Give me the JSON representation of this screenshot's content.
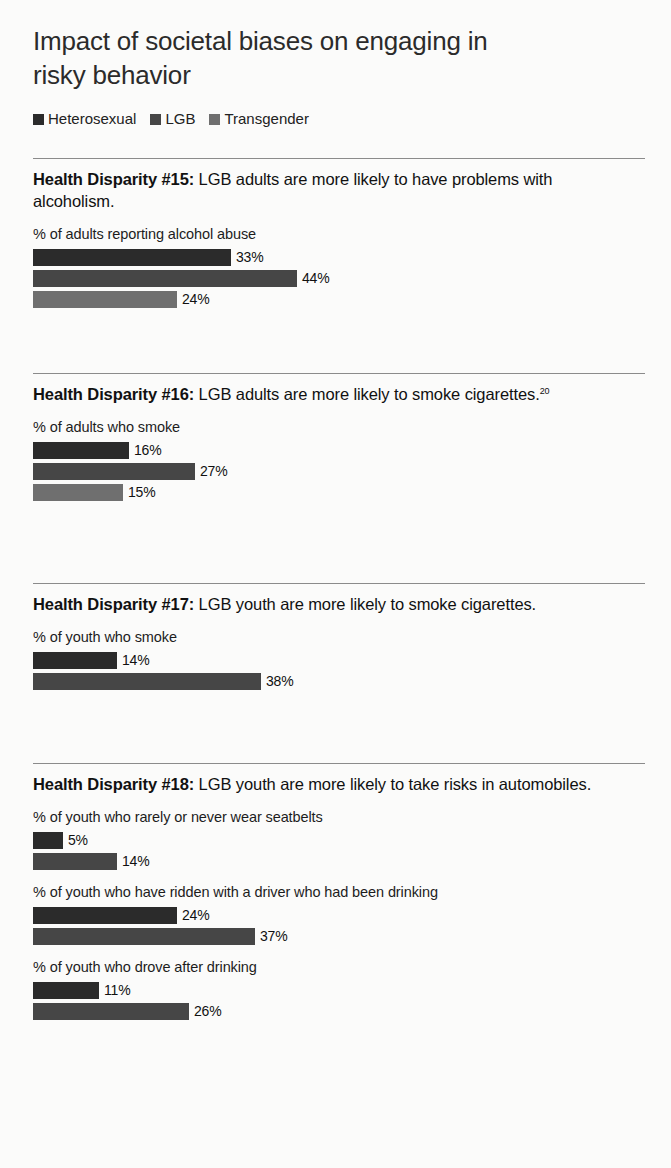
{
  "title": "Impact of societal biases on engaging in risky behavior",
  "legend": {
    "items": [
      {
        "label": "Heterosexual",
        "color": "#2b2b2b"
      },
      {
        "label": "LGB",
        "color": "#464646"
      },
      {
        "label": "Transgender",
        "color": "#6f6f6f"
      }
    ]
  },
  "sections": [
    {
      "heading_bold": "Health Disparity #15:",
      "heading_rest": " LGB adults are more likely to have problems with alcoholism.",
      "footnote": "",
      "groups": [
        {
          "sublabel": "% of adults reporting alcohol abuse",
          "bars": [
            {
              "series": "Heterosexual",
              "value": 33,
              "value_label": "33%",
              "color": "#2b2b2b"
            },
            {
              "series": "LGB",
              "value": 44,
              "value_label": "44%",
              "color": "#464646"
            },
            {
              "series": "Transgender",
              "value": 24,
              "value_label": "24%",
              "color": "#6f6f6f"
            }
          ]
        }
      ]
    },
    {
      "heading_bold": "Health Disparity #16:",
      "heading_rest": " LGB adults are more likely to smoke cigarettes.",
      "footnote": "20",
      "groups": [
        {
          "sublabel": "% of adults who smoke",
          "bars": [
            {
              "series": "Heterosexual",
              "value": 16,
              "value_label": "16%",
              "color": "#2b2b2b"
            },
            {
              "series": "LGB",
              "value": 27,
              "value_label": "27%",
              "color": "#464646"
            },
            {
              "series": "Transgender",
              "value": 15,
              "value_label": "15%",
              "color": "#6f6f6f"
            }
          ]
        }
      ]
    },
    {
      "heading_bold": "Health Disparity #17:",
      "heading_rest": " LGB youth are more likely to smoke cigarettes.",
      "footnote": "",
      "groups": [
        {
          "sublabel": "% of youth who smoke",
          "bars": [
            {
              "series": "Heterosexual",
              "value": 14,
              "value_label": "14%",
              "color": "#2b2b2b"
            },
            {
              "series": "LGB",
              "value": 38,
              "value_label": "38%",
              "color": "#464646"
            }
          ]
        }
      ]
    },
    {
      "heading_bold": "Health Disparity #18:",
      "heading_rest": " LGB youth are more likely to take risks in automobiles.",
      "footnote": "",
      "groups": [
        {
          "sublabel": "% of youth who rarely or never wear seatbelts",
          "bars": [
            {
              "series": "Heterosexual",
              "value": 5,
              "value_label": "5%",
              "color": "#2b2b2b"
            },
            {
              "series": "LGB",
              "value": 14,
              "value_label": "14%",
              "color": "#464646"
            }
          ]
        },
        {
          "sublabel": "% of youth who have ridden with a driver who had been drinking",
          "bars": [
            {
              "series": "Heterosexual",
              "value": 24,
              "value_label": "24%",
              "color": "#2b2b2b"
            },
            {
              "series": "LGB",
              "value": 37,
              "value_label": "37%",
              "color": "#464646"
            }
          ]
        },
        {
          "sublabel": "% of youth who drove after drinking",
          "bars": [
            {
              "series": "Heterosexual",
              "value": 11,
              "value_label": "11%",
              "color": "#2b2b2b"
            },
            {
              "series": "LGB",
              "value": 26,
              "value_label": "26%",
              "color": "#464646"
            }
          ]
        }
      ]
    }
  ],
  "layout": {
    "px_per_percent": 6.0,
    "section_tops": [
      158,
      373,
      583,
      763
    ]
  },
  "chart_data": {
    "type": "bar",
    "title": "Impact of societal biases on engaging in risky behavior",
    "orientation": "horizontal",
    "xlabel": "",
    "ylabel": "",
    "xlim": [
      0,
      50
    ],
    "grid": false,
    "legend_position": "top-left",
    "legend": [
      "Heterosexual",
      "LGB",
      "Transgender"
    ],
    "panels": [
      {
        "heading": "Health Disparity #15: LGB adults are more likely to have problems with alcoholism.",
        "categories": [
          "% of adults reporting alcohol abuse"
        ],
        "series": [
          {
            "name": "Heterosexual",
            "values": [
              33
            ]
          },
          {
            "name": "LGB",
            "values": [
              44
            ]
          },
          {
            "name": "Transgender",
            "values": [
              24
            ]
          }
        ]
      },
      {
        "heading": "Health Disparity #16: LGB adults are more likely to smoke cigarettes.",
        "categories": [
          "% of adults who smoke"
        ],
        "series": [
          {
            "name": "Heterosexual",
            "values": [
              16
            ]
          },
          {
            "name": "LGB",
            "values": [
              27
            ]
          },
          {
            "name": "Transgender",
            "values": [
              15
            ]
          }
        ]
      },
      {
        "heading": "Health Disparity #17: LGB youth are more likely to smoke cigarettes.",
        "categories": [
          "% of youth who smoke"
        ],
        "series": [
          {
            "name": "Heterosexual",
            "values": [
              14
            ]
          },
          {
            "name": "LGB",
            "values": [
              38
            ]
          }
        ]
      },
      {
        "heading": "Health Disparity #18: LGB youth are more likely to take risks in automobiles.",
        "categories": [
          "% of youth who rarely or never wear seatbelts",
          "% of youth who have ridden with a driver who had been drinking",
          "% of youth who drove after drinking"
        ],
        "series": [
          {
            "name": "Heterosexual",
            "values": [
              5,
              24,
              11
            ]
          },
          {
            "name": "LGB",
            "values": [
              14,
              37,
              26
            ]
          }
        ]
      }
    ],
    "annotations": [
      "Footnote marker 20 on Health Disparity #16"
    ]
  }
}
